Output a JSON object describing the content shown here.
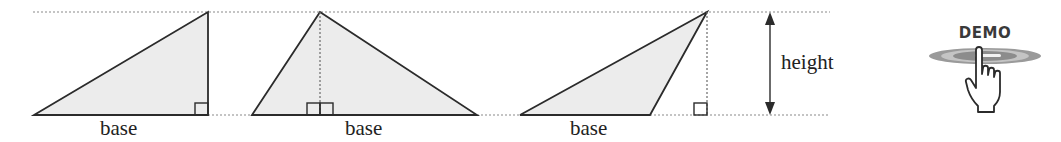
{
  "figure": {
    "type": "triangle-base-height-diagram",
    "colors": {
      "stroke": "#2b2b2b",
      "fill": "#ececec",
      "dotted": "#8a8a8a",
      "label": "#222222"
    },
    "reference_lines": {
      "top_y": 12,
      "baseline_y": 115
    },
    "triangles": [
      {
        "id": "right-triangle",
        "points": [
          [
            34,
            115
          ],
          [
            208,
            12
          ],
          [
            208,
            115
          ]
        ],
        "altitude_x": 208,
        "right_angle_marks": 1,
        "base_label": "base"
      },
      {
        "id": "acute-triangle",
        "points": [
          [
            252,
            115
          ],
          [
            320,
            12
          ],
          [
            477,
            115
          ]
        ],
        "altitude_x": 320,
        "right_angle_marks": 2,
        "base_label": "base"
      },
      {
        "id": "obtuse-triangle",
        "points": [
          [
            520,
            115
          ],
          [
            707,
            12
          ],
          [
            650,
            115
          ]
        ],
        "altitude_x": 707,
        "right_angle_marks": 1,
        "base_label": "base"
      }
    ],
    "height_indicator": {
      "label": "height",
      "arrow_x": 770
    }
  },
  "demo_button": {
    "label": "DEMO",
    "icon": "hand-pointer-icon"
  }
}
